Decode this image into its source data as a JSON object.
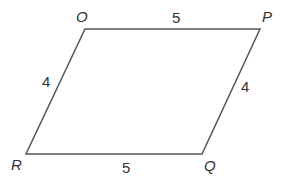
{
  "diagram": {
    "shape": "parallelogram",
    "stroke_color": "#555555",
    "text_color": "#333333",
    "vertices": {
      "O": {
        "label": "O",
        "x": 85,
        "y": 29
      },
      "P": {
        "label": "P",
        "x": 260,
        "y": 29
      },
      "Q": {
        "label": "Q",
        "x": 202,
        "y": 154
      },
      "R": {
        "label": "R",
        "x": 26,
        "y": 154
      }
    },
    "sides": {
      "OP": {
        "label": "5"
      },
      "PQ": {
        "label": "4"
      },
      "QR": {
        "label": "5"
      },
      "RO": {
        "label": "4"
      }
    }
  }
}
